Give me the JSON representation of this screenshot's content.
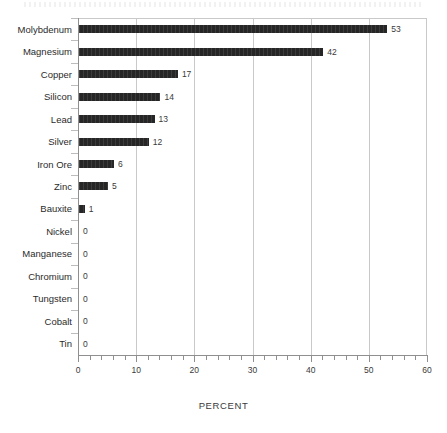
{
  "chart_data": {
    "type": "bar",
    "orientation": "horizontal",
    "title": "",
    "subtitle": "",
    "xlabel": "PERCENT",
    "ylabel": "",
    "xlim": [
      0,
      60
    ],
    "x_major_step": 10,
    "x_minor_step": 2,
    "xticklabels": [
      "0",
      "10",
      "20",
      "30",
      "40",
      "50",
      "60"
    ],
    "grid": "vertical",
    "legend": "none",
    "bar_color": "#262626",
    "gridline_color": "#c9c9c9",
    "axis_color": "#8f8f8f",
    "show_value_labels": true,
    "categories": [
      "Molybdenum",
      "Magnesium",
      "Copper",
      "Silicon",
      "Lead",
      "Silver",
      "Iron Ore",
      "Zinc",
      "Bauxite",
      "Nickel",
      "Manganese",
      "Chromium",
      "Tungsten",
      "Cobalt",
      "Tin"
    ],
    "values": [
      53,
      42,
      17,
      14,
      13,
      12,
      6,
      5,
      1,
      0,
      0,
      0,
      0,
      0,
      0
    ],
    "value_labels": [
      "53",
      "42",
      "17",
      "14",
      "13",
      "12",
      "6",
      "5",
      "1",
      "0",
      "0",
      "0",
      "0",
      "0",
      "0"
    ]
  }
}
